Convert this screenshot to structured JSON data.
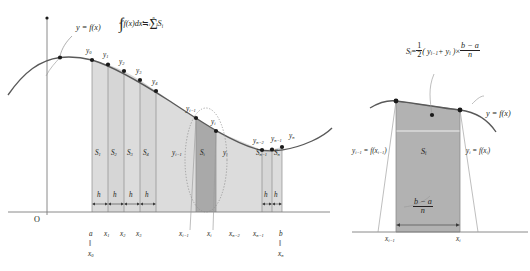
{
  "meta": {
    "header_fragment": "",
    "bg": "#ffffff",
    "ink": "#231f20",
    "fill_light": "#d9d9d9",
    "fill_dark": "#a8a8a8",
    "fill_right": "#b0b0b0",
    "curve": "#4d4d4d"
  },
  "left_diagram": {
    "name": "trapezoidal-rule-overview",
    "curve_label": "y = f(x)",
    "formula": {
      "lhs": "y = f(x)",
      "integral_lower": "a",
      "integral_upper": "b",
      "integrand": "f(x)dx",
      "approx_sign": "≒",
      "sigma_upper": "n",
      "sigma_lower": "i = 1",
      "sigma_term": "S",
      "sigma_term_sub": "i"
    },
    "origin_label": "O",
    "point_labels": [
      {
        "text": "y",
        "sub": "0"
      },
      {
        "text": "y",
        "sub": "1"
      },
      {
        "text": "y",
        "sub": "2"
      },
      {
        "text": "y",
        "sub": "3"
      },
      {
        "text": "y",
        "sub": "4"
      },
      {
        "text": "y",
        "sub": "i−1"
      },
      {
        "text": "y",
        "sub": "i"
      },
      {
        "text": "y",
        "sub": "n−2"
      },
      {
        "text": "y",
        "sub": "n−1"
      },
      {
        "text": "y",
        "sub": "n"
      }
    ],
    "area_labels": [
      {
        "text": "S",
        "sub": "1"
      },
      {
        "text": "S",
        "sub": "2"
      },
      {
        "text": "S",
        "sub": "3"
      },
      {
        "text": "S",
        "sub": "4"
      },
      {
        "text": "S",
        "sub": "i"
      },
      {
        "text": "S",
        "sub": "n−1"
      },
      {
        "text": "S",
        "sub": "n"
      }
    ],
    "strip_marker_left": "y",
    "strip_marker_left_sub": "i−1",
    "strip_marker_right": "y",
    "strip_marker_right_sub": "i",
    "width_labels": [
      "h",
      "h",
      "h",
      "h",
      "h",
      "h"
    ],
    "axis_labels": [
      {
        "text": "a",
        "sub": ""
      },
      {
        "text": "x",
        "sub": "1"
      },
      {
        "text": "x",
        "sub": "2"
      },
      {
        "text": "x",
        "sub": "3"
      },
      {
        "text": "x",
        "sub": "i−1"
      },
      {
        "text": "x",
        "sub": "i"
      },
      {
        "text": "x",
        "sub": "n−2"
      },
      {
        "text": "x",
        "sub": "n−1"
      },
      {
        "text": "b",
        "sub": ""
      }
    ],
    "equiv_left": {
      "top": "a",
      "bar": "‖",
      "bottom": "x",
      "bottom_sub": "0"
    },
    "equiv_right": {
      "top": "b",
      "bar": "‖",
      "bottom": "x",
      "bottom_sub": "n"
    }
  },
  "right_diagram": {
    "name": "single-trapezoid-detail",
    "formula": {
      "lhs": "S",
      "lhs_sub": "i",
      "eq": "=",
      "half_num": "1",
      "half_den": "2",
      "paren": "( y",
      "paren_sub1": "i−1",
      "plus": "+ y",
      "paren_sub2": "i",
      "close": " )",
      "times": "×",
      "frac_num": "b − a",
      "frac_den": "n"
    },
    "curve_label": "y = f(x)",
    "left_height_label": {
      "text": "y",
      "sub": "i−1",
      "eq": " = f(x",
      "sub2": "i−1",
      "tail": ")"
    },
    "right_height_label": {
      "text": "y",
      "sub": "i",
      "eq": " = f(x",
      "sub2": "i",
      "tail": ")"
    },
    "area_label": {
      "text": "S",
      "sub": "i"
    },
    "base_frac_num": "b − a",
    "base_frac_den": "n",
    "axis_labels": [
      {
        "text": "x",
        "sub": "i−1"
      },
      {
        "text": "x",
        "sub": "i"
      }
    ]
  }
}
